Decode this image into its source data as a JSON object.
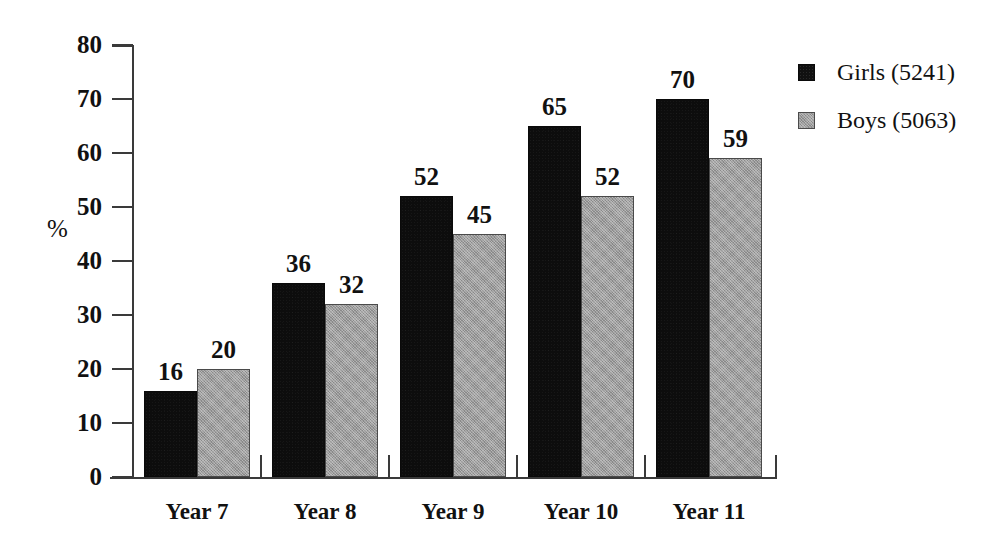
{
  "chart_data": {
    "type": "bar",
    "title": "",
    "subtitle": "",
    "xlabel": "",
    "ylabel": "%",
    "ylim": [
      0,
      80
    ],
    "yticks": [
      0,
      10,
      20,
      30,
      40,
      50,
      60,
      70,
      80
    ],
    "ytick_labels": [
      "0",
      "10",
      "20",
      "30",
      "40",
      "50",
      "60",
      "70",
      "80"
    ],
    "grid": false,
    "legend_position": "right-top",
    "categories": [
      "Year 7",
      "Year 8",
      "Year 9",
      "Year 10",
      "Year 11"
    ],
    "series": [
      {
        "name": "Girls (5241)",
        "short_name": "Girls",
        "count": "5241",
        "color": "#111111",
        "fill": "solid-black",
        "values": [
          16,
          20,
          36,
          32,
          52
        ]
      },
      {
        "name": "Boys (5063)",
        "short_name": "Boys",
        "count": "5063",
        "color": "#9d9d9d",
        "fill": "gray-halftone",
        "values": [
          20,
          32,
          45,
          52,
          59
        ]
      }
    ],
    "groups": [
      {
        "category": "Year 7",
        "girls_value": 16,
        "boys_value": 20,
        "girls_label": "16",
        "boys_label": "20"
      },
      {
        "category": "Year 8",
        "girls_value": 36,
        "boys_value": 32,
        "girls_label": "36",
        "boys_label": "32"
      },
      {
        "category": "Year 9",
        "girls_value": 52,
        "boys_value": 45,
        "girls_label": "52",
        "boys_label": "45"
      },
      {
        "category": "Year 10",
        "girls_value": 65,
        "boys_value": 52,
        "girls_label": "65",
        "boys_label": "52"
      },
      {
        "category": "Year 11",
        "girls_value": 70,
        "boys_value": 59,
        "girls_label": "70",
        "boys_label": "59"
      }
    ]
  },
  "legend": {
    "items": [
      {
        "label": "Girls (5241)",
        "swatch": "black-square"
      },
      {
        "label": "Boys (5063)",
        "swatch": "gray-square"
      }
    ]
  },
  "axes": {
    "y_unit": "%",
    "y_tick_labels": [
      "80",
      "70",
      "60",
      "50",
      "40",
      "30",
      "20",
      "10",
      "0"
    ],
    "x_tick_labels": [
      "Year 7",
      "Year 8",
      "Year 9",
      "Year 10",
      "Year 11"
    ]
  },
  "colors": {
    "background": "#ffffff",
    "axis": "#3a3a3a",
    "text": "#111111",
    "series_girls": "#111111",
    "series_boys": "#9d9d9d"
  }
}
